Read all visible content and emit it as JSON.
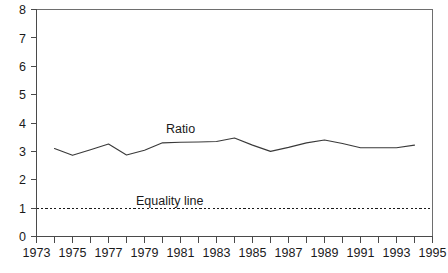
{
  "chart_data": {
    "type": "line",
    "title": "",
    "xlabel": "",
    "ylabel": "",
    "xlim": [
      1973,
      1995
    ],
    "ylim": [
      0,
      8
    ],
    "grid": false,
    "legend_position": "inline-annotation",
    "x_ticks": [
      1973,
      1974,
      1975,
      1976,
      1977,
      1978,
      1979,
      1980,
      1981,
      1982,
      1983,
      1984,
      1985,
      1986,
      1987,
      1988,
      1989,
      1990,
      1991,
      1992,
      1993,
      1994,
      1995
    ],
    "x_tick_labels": [
      "1973",
      "",
      "1975",
      "",
      "1977",
      "",
      "1979",
      "",
      "1981",
      "",
      "1983",
      "",
      "1985",
      "",
      "1987",
      "",
      "1989",
      "",
      "1991",
      "",
      "1993",
      "",
      "1995"
    ],
    "y_ticks": [
      0,
      1,
      2,
      3,
      4,
      5,
      6,
      7,
      8
    ],
    "y_tick_labels": [
      "0",
      "1",
      "2",
      "3",
      "4",
      "5",
      "6",
      "7",
      "8"
    ],
    "series": [
      {
        "name": "Ratio",
        "style": "solid",
        "color": "#3a3a3a",
        "annotation_label": "Ratio",
        "x": [
          1974,
          1975,
          1976,
          1977,
          1978,
          1979,
          1980,
          1981,
          1982,
          1983,
          1984,
          1985,
          1986,
          1987,
          1988,
          1989,
          1990,
          1991,
          1992,
          1993,
          1994
        ],
        "values": [
          3.1,
          2.86,
          3.06,
          3.26,
          2.87,
          3.04,
          3.3,
          3.32,
          3.33,
          3.35,
          3.47,
          3.22,
          3.0,
          3.14,
          3.3,
          3.4,
          3.28,
          3.13,
          3.13,
          3.13,
          3.22
        ]
      },
      {
        "name": "Equality line",
        "style": "dashed",
        "color": "#1a1a1a",
        "annotation_label": "Equality line",
        "constant_value": 1.0,
        "x": [
          1973,
          1995
        ],
        "values": [
          1.0,
          1.0
        ]
      }
    ],
    "annotations": [
      {
        "text": "Ratio",
        "x": 1981.0,
        "y": 3.78
      },
      {
        "text": "Equality line",
        "x": 1980.4,
        "y": 1.25
      }
    ]
  }
}
